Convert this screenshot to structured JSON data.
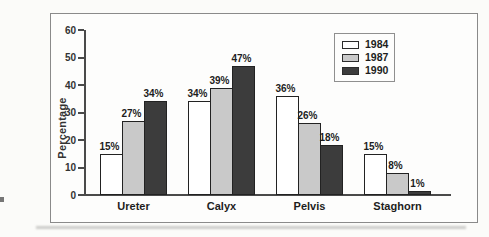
{
  "figure": {
    "background": "#fdfdfc",
    "border_color": "#8a8a8a"
  },
  "chart_data": {
    "type": "bar",
    "title": "",
    "xlabel": "",
    "ylabel": "Percentage",
    "ylim": [
      0,
      60
    ],
    "yticks": [
      0,
      10,
      20,
      30,
      40,
      50,
      60
    ],
    "grid": false,
    "legend_position": "top-right-inside",
    "categories": [
      "Ureter",
      "Calyx",
      "Pelvis",
      "Staghorn"
    ],
    "series": [
      {
        "name": "1984",
        "color": "#ffffff",
        "values": [
          15,
          34,
          36,
          15
        ]
      },
      {
        "name": "1987",
        "color": "#c9c9c9",
        "values": [
          27,
          39,
          26,
          8
        ]
      },
      {
        "name": "1990",
        "color": "#3c3c3c",
        "values": [
          34,
          47,
          18,
          1
        ]
      }
    ],
    "value_label_format": "{v}%",
    "bar_outline_color": "#222222",
    "axis_color": "#4a4a4a"
  }
}
